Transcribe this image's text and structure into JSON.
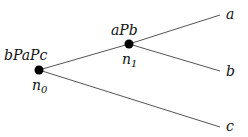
{
  "diagram": {
    "type": "tree",
    "nodes": [
      {
        "id": "n0",
        "label_top": "bPaPc",
        "label_bottom_base": "n",
        "label_bottom_sub": "0",
        "x": 39,
        "y": 70
      },
      {
        "id": "n1",
        "label_top": "aPb",
        "label_bottom_base": "n",
        "label_bottom_sub": "1",
        "x": 129,
        "y": 44
      }
    ],
    "leaves": [
      {
        "id": "a",
        "label": "a",
        "x": 220,
        "y": 15
      },
      {
        "id": "b",
        "label": "b",
        "x": 220,
        "y": 71
      },
      {
        "id": "c",
        "label": "c",
        "x": 220,
        "y": 127
      }
    ],
    "edges": [
      {
        "from": "n0",
        "to": "n1"
      },
      {
        "from": "n1",
        "to": "a"
      },
      {
        "from": "n1",
        "to": "b"
      },
      {
        "from": "n0",
        "to": "c"
      }
    ],
    "colors": {
      "line": "#555555",
      "node": "#000000",
      "text": "#111111"
    }
  }
}
